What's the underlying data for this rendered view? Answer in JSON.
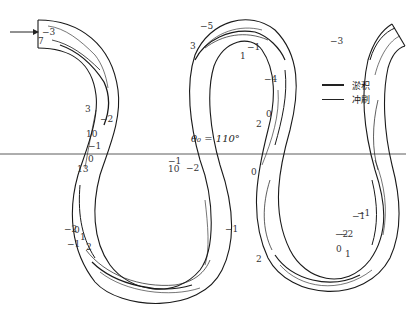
{
  "diagram": {
    "type": "meandering-channel-bed-contour-map",
    "angle_label": "θ₀ = 110°",
    "flow_direction": "arrow-right-icon",
    "legend": [
      {
        "label": "淤积",
        "style": "thick"
      },
      {
        "label": "冲刷",
        "style": "thin"
      }
    ],
    "contour_labels": [
      {
        "text": "−3",
        "x": 42,
        "y": 28
      },
      {
        "text": "7",
        "x": 38,
        "y": 37
      },
      {
        "text": "−5",
        "x": 200,
        "y": 22
      },
      {
        "text": "3",
        "x": 190,
        "y": 42
      },
      {
        "text": "−1",
        "x": 247,
        "y": 43
      },
      {
        "text": "1",
        "x": 240,
        "y": 52
      },
      {
        "text": "−4",
        "x": 264,
        "y": 75
      },
      {
        "text": "−3",
        "x": 330,
        "y": 37
      },
      {
        "text": "3",
        "x": 85,
        "y": 105
      },
      {
        "text": "10",
        "x": 86,
        "y": 130
      },
      {
        "text": "−2",
        "x": 100,
        "y": 115
      },
      {
        "text": "−1",
        "x": 88,
        "y": 142
      },
      {
        "text": "0",
        "x": 88,
        "y": 155
      },
      {
        "text": "13",
        "x": 77,
        "y": 165
      },
      {
        "text": "−1",
        "x": 168,
        "y": 157
      },
      {
        "text": "10",
        "x": 168,
        "y": 165
      },
      {
        "text": "−2",
        "x": 186,
        "y": 164
      },
      {
        "text": "0",
        "x": 266,
        "y": 110
      },
      {
        "text": "2",
        "x": 256,
        "y": 120
      },
      {
        "text": "0",
        "x": 251,
        "y": 168
      },
      {
        "text": "−2",
        "x": 64,
        "y": 225
      },
      {
        "text": "0",
        "x": 74,
        "y": 226
      },
      {
        "text": "1",
        "x": 80,
        "y": 233
      },
      {
        "text": "−1",
        "x": 67,
        "y": 240
      },
      {
        "text": "2",
        "x": 86,
        "y": 243
      },
      {
        "text": "−1",
        "x": 225,
        "y": 225
      },
      {
        "text": "2",
        "x": 256,
        "y": 255
      },
      {
        "text": "−1",
        "x": 352,
        "y": 212
      },
      {
        "text": "−2",
        "x": 340,
        "y": 230
      },
      {
        "text": "1",
        "x": 345,
        "y": 250
      },
      {
        "text": "0",
        "x": 336,
        "y": 245
      },
      {
        "text": "−1",
        "x": 357,
        "y": 209
      },
      {
        "text": "−2",
        "x": 335,
        "y": 230
      }
    ],
    "colors": {
      "line": "#1a1a1a",
      "background": "#ffffff"
    }
  }
}
